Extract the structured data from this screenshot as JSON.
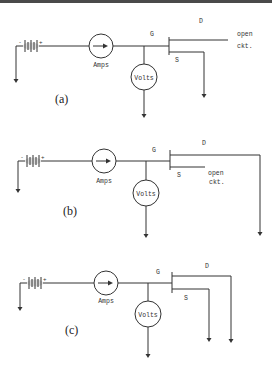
{
  "figure": {
    "width": 272,
    "height": 377,
    "colors": {
      "line": "#333333",
      "topbar": "#4a4a4a",
      "background": "#ffffff"
    },
    "labels": {
      "amps": "Amps",
      "volts": "Volts",
      "gate": "G",
      "drain": "D",
      "source": "S",
      "open": "open",
      "ckt": "ckt.",
      "minus": "-",
      "plus": "+"
    },
    "circuits": [
      {
        "id": "a",
        "caption": "(a)",
        "caption_pos": [
          55,
          103
        ],
        "y": 46,
        "ground_x": 16,
        "ground_y": 83,
        "battery_x": 23,
        "amps": {
          "cx": 101,
          "r": 12,
          "label_y": 67
        },
        "junction_x": 144,
        "volts": {
          "cy": 77,
          "r": 13,
          "arrow_y": 118
        },
        "gate_x": 169,
        "gate_top": 37,
        "gate_bot": 55,
        "drain_y": 40,
        "source_y": 52,
        "drain_end_x": 228,
        "drain_down": null,
        "source_end_x": 204,
        "source_down": 98,
        "G_pos": [
          150,
          36
        ],
        "D_pos": [
          199,
          23
        ],
        "S_pos": [
          175,
          62
        ],
        "open_pos": [
          237,
          36
        ],
        "ckt_pos": [
          237,
          48
        ]
      },
      {
        "id": "b",
        "caption": "(b)",
        "caption_pos": [
          63,
          215
        ],
        "y": 161,
        "ground_x": 18,
        "ground_y": 193,
        "battery_x": 25,
        "amps": {
          "cx": 104,
          "r": 12,
          "label_y": 183
        },
        "junction_x": 146,
        "volts": {
          "cy": 193,
          "r": 13,
          "arrow_y": 238
        },
        "gate_x": 170,
        "gate_top": 150,
        "gate_bot": 170,
        "drain_y": 155,
        "source_y": 167,
        "drain_end_x": 260,
        "drain_down": 236,
        "source_end_x": 205,
        "source_down": null,
        "G_pos": [
          152,
          152
        ],
        "D_pos": [
          202,
          145
        ],
        "S_pos": [
          177,
          177
        ],
        "open_pos": [
          208,
          175
        ],
        "ckt_pos": [
          209,
          184
        ]
      },
      {
        "id": "c",
        "caption": "(c)",
        "caption_pos": [
          65,
          334
        ],
        "y": 283,
        "ground_x": 20,
        "ground_y": 311,
        "battery_x": 27,
        "amps": {
          "cx": 106,
          "r": 12,
          "label_y": 303
        },
        "junction_x": 148,
        "volts": {
          "cy": 314,
          "r": 13,
          "arrow_y": 358
        },
        "gate_x": 172,
        "gate_top": 272,
        "gate_bot": 293,
        "drain_y": 276,
        "source_y": 289,
        "drain_end_x": 231,
        "drain_down": 343,
        "source_end_x": 209,
        "source_down": 342,
        "G_pos": [
          156,
          274
        ],
        "D_pos": [
          205,
          268
        ],
        "S_pos": [
          184,
          300
        ],
        "open_pos": null,
        "ckt_pos": null
      }
    ]
  }
}
